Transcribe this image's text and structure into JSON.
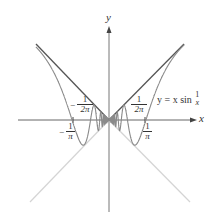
{
  "figure": {
    "function_label": {
      "prefix": "y = x sin",
      "frac_num": "1",
      "frac_den": "x"
    },
    "axes": {
      "x_label": "x",
      "y_label": "y"
    },
    "tick_labels": {
      "neg_inv_pi": {
        "sign": "−",
        "num": "1",
        "den": "π"
      },
      "neg_inv_2pi": {
        "sign": "−",
        "num": "1",
        "den": "2π"
      },
      "inv_2pi": {
        "num": "1",
        "den": "2π"
      },
      "inv_pi": {
        "num": "1",
        "den": "π"
      }
    },
    "colors": {
      "curve": "#8a8a8a",
      "bounds_upper": "#555555",
      "bounds_lower": "#d4d4d4",
      "axes": "#666666",
      "text": "#333333"
    }
  }
}
